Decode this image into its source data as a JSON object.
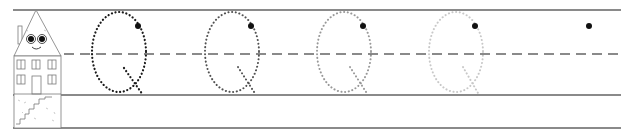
{
  "worksheet": {
    "letter": "Q",
    "case": "uppercase",
    "activity": "letter tracing",
    "guide_lines": {
      "top_y": 10,
      "midline_y": 54,
      "baseline_y": 95,
      "bottom_y": 128,
      "line_color": "#8a8a8a",
      "midline_style": "dashed"
    },
    "mascot": "house-with-face",
    "tracing_letters": [
      {
        "index": 1,
        "center_x": 119,
        "opacity": 1.0,
        "dot_color": "#1a1a1a"
      },
      {
        "index": 2,
        "center_x": 232,
        "opacity": 0.85,
        "dot_color": "#333333"
      },
      {
        "index": 3,
        "center_x": 344,
        "opacity": 0.6,
        "dot_color": "#666666"
      },
      {
        "index": 4,
        "center_x": 455,
        "opacity": 0.35,
        "dot_color": "#999999"
      }
    ],
    "start_dots": [
      {
        "x": 138,
        "y": 26
      },
      {
        "x": 251,
        "y": 26
      },
      {
        "x": 363,
        "y": 26
      },
      {
        "x": 475,
        "y": 26
      },
      {
        "x": 589,
        "y": 26
      }
    ],
    "colors": {
      "background": "#ffffff",
      "rule": "#8a8a8a",
      "start_dot": "#111111",
      "house_line": "#7a7a7a"
    }
  }
}
